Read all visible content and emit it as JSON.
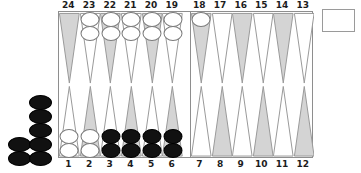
{
  "board": {
    "game": "backgammon",
    "colors": {
      "point_shaded": "#d4d4d4",
      "point_light": "#ffffff",
      "point_outline": "#9a9a9a",
      "board_border": "#8e8e8e",
      "checker_black": "#111111",
      "checker_white": "#ffffff",
      "checker_white_outline": "#7a7a7a",
      "label_text": "#1c1c1c",
      "background": "#ffffff"
    },
    "quadrants": {
      "top_left": {
        "name": "top-left-quadrant",
        "labels": [
          "24",
          "23",
          "22",
          "21",
          "20",
          "19"
        ],
        "points": [
          {
            "number": "24",
            "shade": "shaded",
            "checkers": 0,
            "color": ""
          },
          {
            "number": "23",
            "shade": "light",
            "checkers": 2,
            "color": "white"
          },
          {
            "number": "22",
            "shade": "shaded",
            "checkers": 2,
            "color": "white"
          },
          {
            "number": "21",
            "shade": "light",
            "checkers": 2,
            "color": "white"
          },
          {
            "number": "20",
            "shade": "shaded",
            "checkers": 2,
            "color": "white"
          },
          {
            "number": "19",
            "shade": "light",
            "checkers": 2,
            "color": "white"
          }
        ]
      },
      "top_right": {
        "name": "top-right-quadrant",
        "labels": [
          "18",
          "17",
          "16",
          "15",
          "14",
          "13"
        ],
        "points": [
          {
            "number": "18",
            "shade": "shaded",
            "checkers": 1,
            "color": "white"
          },
          {
            "number": "17",
            "shade": "light",
            "checkers": 0,
            "color": ""
          },
          {
            "number": "16",
            "shade": "shaded",
            "checkers": 0,
            "color": ""
          },
          {
            "number": "15",
            "shade": "light",
            "checkers": 0,
            "color": ""
          },
          {
            "number": "14",
            "shade": "shaded",
            "checkers": 0,
            "color": ""
          },
          {
            "number": "13",
            "shade": "light",
            "checkers": 0,
            "color": ""
          }
        ]
      },
      "bottom_left": {
        "name": "bottom-left-quadrant",
        "labels": [
          "1",
          "2",
          "3",
          "4",
          "5",
          "6"
        ],
        "points": [
          {
            "number": "1",
            "shade": "light",
            "checkers": 2,
            "color": "white"
          },
          {
            "number": "2",
            "shade": "shaded",
            "checkers": 2,
            "color": "white"
          },
          {
            "number": "3",
            "shade": "light",
            "checkers": 2,
            "color": "black"
          },
          {
            "number": "4",
            "shade": "shaded",
            "checkers": 2,
            "color": "black"
          },
          {
            "number": "5",
            "shade": "light",
            "checkers": 2,
            "color": "black"
          },
          {
            "number": "6",
            "shade": "shaded",
            "checkers": 2,
            "color": "black"
          }
        ]
      },
      "bottom_right": {
        "name": "bottom-right-quadrant",
        "labels": [
          "7",
          "8",
          "9",
          "10",
          "11",
          "12"
        ],
        "points": [
          {
            "number": "7",
            "shade": "light",
            "checkers": 0,
            "color": ""
          },
          {
            "number": "8",
            "shade": "shaded",
            "checkers": 0,
            "color": ""
          },
          {
            "number": "9",
            "shade": "light",
            "checkers": 0,
            "color": ""
          },
          {
            "number": "10",
            "shade": "shaded",
            "checkers": 0,
            "color": ""
          },
          {
            "number": "11",
            "shade": "light",
            "checkers": 0,
            "color": ""
          },
          {
            "number": "12",
            "shade": "shaded",
            "checkers": 0,
            "color": ""
          }
        ]
      }
    },
    "off_board": {
      "name": "black-borne-off-pile",
      "color": "black",
      "total": 7,
      "columns": [
        {
          "name": "off-column-left",
          "checkers": 2
        },
        {
          "name": "off-column-right",
          "checkers": 5
        }
      ]
    },
    "tray": {
      "name": "dice-tray",
      "label": "",
      "contents": []
    }
  }
}
